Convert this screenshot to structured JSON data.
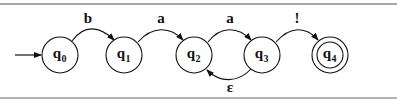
{
  "diagram": {
    "type": "finite-state-automaton",
    "colors": {
      "stroke": "#111111",
      "border": "#8a8a8a",
      "background": "#ffffff"
    },
    "states": [
      {
        "id": "q0",
        "letter": "q",
        "sub": "0",
        "cx": 60,
        "cy": 55,
        "start": true,
        "accept": false
      },
      {
        "id": "q1",
        "letter": "q",
        "sub": "1",
        "cx": 124,
        "cy": 55,
        "start": false,
        "accept": false
      },
      {
        "id": "q2",
        "letter": "q",
        "sub": "2",
        "cx": 194,
        "cy": 55,
        "start": false,
        "accept": false
      },
      {
        "id": "q3",
        "letter": "q",
        "sub": "3",
        "cx": 262,
        "cy": 55,
        "start": false,
        "accept": false
      },
      {
        "id": "q4",
        "letter": "q",
        "sub": "4",
        "cx": 330,
        "cy": 55,
        "start": false,
        "accept": true
      }
    ],
    "transitions": [
      {
        "from": "q0",
        "to": "q1",
        "label": "b"
      },
      {
        "from": "q1",
        "to": "q2",
        "label": "a"
      },
      {
        "from": "q2",
        "to": "q3",
        "label": "a"
      },
      {
        "from": "q3",
        "to": "q2",
        "label": "ε"
      },
      {
        "from": "q3",
        "to": "q4",
        "label": "!"
      }
    ]
  }
}
